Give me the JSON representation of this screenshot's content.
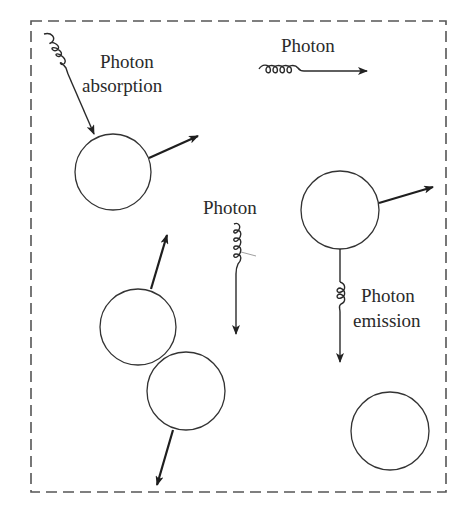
{
  "diagram": {
    "boundary": {
      "style": "dashed",
      "x": 31,
      "y": 21,
      "width": 415,
      "height": 471
    },
    "labels": {
      "absorption_line1": "Photon",
      "absorption_line2": "absorption",
      "free_photon_top": "Photon",
      "free_photon_middle": "Photon",
      "emission_line1": "Photon",
      "emission_line2": "emission"
    },
    "particles": [
      {
        "id": "particle-absorbing",
        "cx": 113,
        "cy": 172,
        "r": 38
      },
      {
        "id": "particle-emitting",
        "cx": 340,
        "cy": 210,
        "r": 39
      },
      {
        "id": "particle-colliding-a",
        "cx": 138,
        "cy": 327,
        "r": 38
      },
      {
        "id": "particle-colliding-b",
        "cx": 186,
        "cy": 391,
        "r": 39
      },
      {
        "id": "particle-at-rest",
        "cx": 390,
        "cy": 431,
        "r": 39
      }
    ],
    "colors": {
      "stroke": "#333333",
      "arrow": "#1e1e1e",
      "text": "#2a2a2a",
      "boundary": "#555555",
      "background": "#ffffff"
    }
  }
}
